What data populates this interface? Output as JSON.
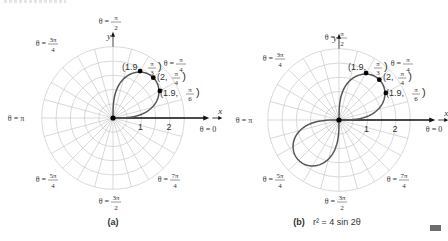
{
  "figure": {
    "top_caption_cropped": "",
    "end_marker_color": "#6d6d6d",
    "colors": {
      "grid": "#c8c8c8",
      "curve": "#555555",
      "axis": "#111111",
      "text": "#333333",
      "point": "#000000"
    }
  },
  "panels": [
    {
      "id": "a",
      "caption": "(a)",
      "equation": "",
      "center": [
        113,
        118
      ],
      "unit_px": 28.5,
      "rings": 5,
      "ring_step": 0.5,
      "spokes": 24,
      "x_axis_label": "x",
      "y_axis_label": "y",
      "tick_labels": [
        "1",
        "2"
      ],
      "angle_labels": [
        {
          "text": "θ = π/2",
          "x": 113,
          "y": 24
        },
        {
          "text": "θ = 3π/4",
          "x": 50,
          "y": 46
        },
        {
          "text": "θ = π/4",
          "x": 178,
          "y": 66
        },
        {
          "text": "θ = π",
          "x": 16,
          "y": 121
        },
        {
          "text": "θ = 0",
          "x": 208,
          "y": 132
        },
        {
          "text": "θ = 5π/4",
          "x": 50,
          "y": 182
        },
        {
          "text": "θ = 7π/4",
          "x": 172,
          "y": 182
        },
        {
          "text": "θ = 3π/2",
          "x": 113,
          "y": 204
        }
      ],
      "loops": [
        [
          0,
          1.5708
        ]
      ],
      "points": [
        {
          "r": 1.9,
          "theta": 1.0472,
          "label_r": "1.9",
          "label_theta": "π/3",
          "lx": 122,
          "ly": 70
        },
        {
          "r": 2.0,
          "theta": 0.7854,
          "label_r": "2",
          "label_theta": "π/4",
          "lx": 157,
          "ly": 80
        },
        {
          "r": 1.9,
          "theta": 0.5236,
          "label_r": "1.9",
          "label_theta": "π/6",
          "lx": 160,
          "ly": 96
        }
      ]
    },
    {
      "id": "b",
      "caption": "(b)",
      "equation": "r² = 4 sin 2θ",
      "center": [
        339,
        120
      ],
      "unit_px": 28.5,
      "rings": 5,
      "ring_step": 0.5,
      "spokes": 24,
      "x_axis_label": "x",
      "y_axis_label": "y",
      "tick_labels": [
        "1",
        "2"
      ],
      "angle_labels": [
        {
          "text": "θ = π/2",
          "x": 339,
          "y": 40
        },
        {
          "text": "θ = 3π/4",
          "x": 277,
          "y": 61
        },
        {
          "text": "θ = π/4",
          "x": 405,
          "y": 66
        },
        {
          "text": "θ = π",
          "x": 244,
          "y": 123
        },
        {
          "text": "θ = 0",
          "x": 434,
          "y": 132
        },
        {
          "text": "θ = 5π/4",
          "x": 277,
          "y": 182
        },
        {
          "text": "θ = 7π/4",
          "x": 401,
          "y": 182
        },
        {
          "text": "θ = 3π/2",
          "x": 339,
          "y": 204
        }
      ],
      "loops": [
        [
          0,
          1.5708
        ],
        [
          3.1416,
          4.7124
        ]
      ],
      "points": [
        {
          "r": 1.9,
          "theta": 1.0472,
          "label_r": "1.9",
          "label_theta": "π/3",
          "lx": 348,
          "ly": 70
        },
        {
          "r": 2.0,
          "theta": 0.7854,
          "label_r": "2",
          "label_theta": "π/4",
          "lx": 383,
          "ly": 80
        },
        {
          "r": 1.9,
          "theta": 0.5236,
          "label_r": "1.9",
          "label_theta": "π/6",
          "lx": 386,
          "ly": 96
        }
      ]
    }
  ]
}
